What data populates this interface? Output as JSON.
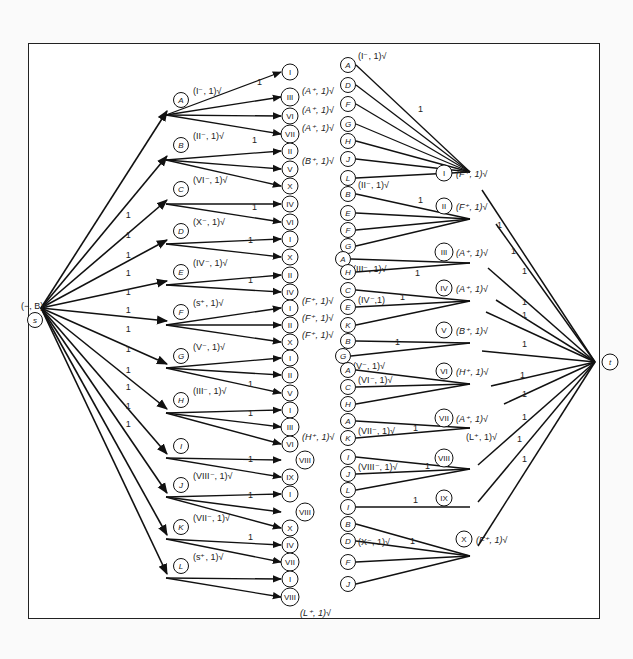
{
  "figure": {
    "stroke_color": "#111111",
    "border_color": "#222222"
  },
  "source": {
    "id": "s",
    "x": 35,
    "y": 308,
    "label": "(−, B)√"
  },
  "sink": {
    "id": "t",
    "x": 615,
    "y": 362
  },
  "left_nodes": [
    {
      "id": "A",
      "x": 181,
      "y": 100,
      "label": "(I⁻, 1)√",
      "hub_y": 115
    },
    {
      "id": "B",
      "x": 181,
      "y": 145,
      "label": "(II⁻, 1)√",
      "hub_y": 160
    },
    {
      "id": "C",
      "x": 181,
      "y": 189,
      "label": "(VI⁻, 1)√",
      "hub_y": 204
    },
    {
      "id": "D",
      "x": 181,
      "y": 231,
      "label": "(X⁻, 1)√",
      "hub_y": 244
    },
    {
      "id": "E",
      "x": 181,
      "y": 272,
      "label": "(IV⁻, 1)√",
      "hub_y": 285
    },
    {
      "id": "F",
      "x": 181,
      "y": 312,
      "label": "(s⁺, 1)√",
      "hub_y": 325
    },
    {
      "id": "G",
      "x": 181,
      "y": 356,
      "label": "(V⁻, 1)√",
      "hub_y": 368
    },
    {
      "id": "H",
      "x": 181,
      "y": 400,
      "label": "(III⁻, 1)√",
      "hub_y": 413
    },
    {
      "id": "I",
      "x": 181,
      "y": 446,
      "label": "",
      "hub_y": 458
    },
    {
      "id": "J",
      "x": 181,
      "y": 485,
      "label": "(VIII⁻, 1)√",
      "hub_y": 497
    },
    {
      "id": "K",
      "x": 181,
      "y": 527,
      "label": "(VII⁻, 1)√",
      "hub_y": 539
    },
    {
      "id": "L",
      "x": 181,
      "y": 566,
      "label": "(s⁺, 1)√",
      "hub_y": 578
    }
  ],
  "source_edges_label": "1",
  "mid_nodes": [
    {
      "id": "I",
      "x": 290,
      "y": 72,
      "from": "A",
      "label": ""
    },
    {
      "id": "III",
      "x": 290,
      "y": 97,
      "from": "A",
      "label": "(A⁺, 1)√",
      "lx": 302,
      "ly": 88
    },
    {
      "id": "VI",
      "x": 290,
      "y": 116,
      "from": "A",
      "label": "(A⁺, 1)√",
      "lx": 302,
      "ly": 107
    },
    {
      "id": "VII",
      "x": 290,
      "y": 134,
      "from": "A",
      "label": "(A⁺, 1)√",
      "lx": 302,
      "ly": 125
    },
    {
      "id": "II",
      "x": 290,
      "y": 151,
      "from": "B",
      "label": ""
    },
    {
      "id": "V",
      "x": 290,
      "y": 169,
      "from": "B",
      "label": "(B⁺, 1)√",
      "lx": 302,
      "ly": 158
    },
    {
      "id": "X",
      "x": 290,
      "y": 186,
      "from": "B",
      "label": ""
    },
    {
      "id": "IV",
      "x": 290,
      "y": 204,
      "from": "C",
      "label": ""
    },
    {
      "id": "VI",
      "x": 290,
      "y": 222,
      "from": "C",
      "label": ""
    },
    {
      "id": "I",
      "x": 290,
      "y": 239,
      "from": "D",
      "label": ""
    },
    {
      "id": "X",
      "x": 290,
      "y": 257,
      "from": "D",
      "label": ""
    },
    {
      "id": "II",
      "x": 290,
      "y": 275,
      "from": "E",
      "label": ""
    },
    {
      "id": "IV",
      "x": 290,
      "y": 292,
      "from": "E",
      "label": ""
    },
    {
      "id": "I",
      "x": 290,
      "y": 308,
      "from": "F",
      "label": "(F⁺, 1)√",
      "lx": 302,
      "ly": 298
    },
    {
      "id": "II",
      "x": 290,
      "y": 325,
      "from": "F",
      "label": "(F⁺, 1)√",
      "lx": 302,
      "ly": 315
    },
    {
      "id": "X",
      "x": 290,
      "y": 342,
      "from": "F",
      "label": "(F⁺, 1)√",
      "lx": 302,
      "ly": 332
    },
    {
      "id": "I",
      "x": 290,
      "y": 358,
      "from": "G",
      "label": ""
    },
    {
      "id": "II",
      "x": 290,
      "y": 375,
      "from": "G",
      "label": ""
    },
    {
      "id": "V",
      "x": 290,
      "y": 393,
      "from": "G",
      "label": ""
    },
    {
      "id": "I",
      "x": 290,
      "y": 410,
      "from": "H",
      "label": ""
    },
    {
      "id": "III",
      "x": 290,
      "y": 427,
      "from": "H",
      "label": ""
    },
    {
      "id": "VI",
      "x": 290,
      "y": 444,
      "from": "H",
      "label": "(H⁺, 1)√",
      "lx": 302,
      "ly": 434
    },
    {
      "id": "VIII",
      "x": 305,
      "y": 460,
      "from": null,
      "label": ""
    },
    {
      "id": "IX",
      "x": 290,
      "y": 477,
      "from": "I",
      "label": ""
    },
    {
      "id": "I",
      "x": 290,
      "y": 494,
      "from": "J",
      "label": ""
    },
    {
      "id": "VIII",
      "x": 305,
      "y": 512,
      "from": null,
      "label": ""
    },
    {
      "id": "X",
      "x": 290,
      "y": 528,
      "from": "J",
      "label": ""
    },
    {
      "id": "IV",
      "x": 290,
      "y": 545,
      "from": "K",
      "label": ""
    },
    {
      "id": "VII",
      "x": 290,
      "y": 562,
      "from": "K",
      "label": ""
    },
    {
      "id": "I",
      "x": 290,
      "y": 579,
      "from": "L",
      "label": ""
    },
    {
      "id": "VIII",
      "x": 290,
      "y": 597,
      "from": "L",
      "label": "(L⁺, 1)√",
      "lx": 300,
      "ly": 610
    }
  ],
  "mid_extra_arrows": [
    {
      "from": "I",
      "to_y": 460
    },
    {
      "from": "J",
      "to_y": 512
    }
  ],
  "left_edge_flow_labels": [
    {
      "text": "1",
      "x": 257,
      "y": 85
    },
    {
      "text": "1",
      "x": 252,
      "y": 143
    },
    {
      "text": "1",
      "x": 252,
      "y": 210
    },
    {
      "text": "1",
      "x": 248,
      "y": 243
    },
    {
      "text": "1",
      "x": 248,
      "y": 283
    },
    {
      "text": "1",
      "x": 248,
      "y": 387
    },
    {
      "text": "1",
      "x": 248,
      "y": 416
    },
    {
      "text": "1",
      "x": 248,
      "y": 462
    },
    {
      "text": "1",
      "x": 248,
      "y": 498
    },
    {
      "text": "1",
      "x": 248,
      "y": 540
    }
  ],
  "right_groups": [
    {
      "target": "I",
      "tx": 444,
      "ty": 173,
      "label": "(F⁺, 1)√",
      "hub_x": 470,
      "hub_y": 172,
      "items": [
        {
          "id": "A",
          "y": 65,
          "label": "(I⁻, 1)√",
          "lpos": "top"
        },
        {
          "id": "D",
          "y": 85
        },
        {
          "id": "F",
          "y": 104
        },
        {
          "id": "G",
          "y": 124
        },
        {
          "id": "H",
          "y": 141
        },
        {
          "id": "J",
          "y": 159
        },
        {
          "id": "L",
          "y": 178
        }
      ],
      "flow_label": {
        "text": "1",
        "x": 418,
        "y": 112
      }
    },
    {
      "target": "II",
      "tx": 444,
      "ty": 206,
      "label": "(F⁺, 1)√",
      "hub_x": 470,
      "hub_y": 219,
      "items": [
        {
          "id": "B",
          "y": 194,
          "label": "(II⁻, 1)√",
          "lpos": "top"
        },
        {
          "id": "E",
          "y": 213
        },
        {
          "id": "F",
          "y": 230
        },
        {
          "id": "G",
          "y": 246
        }
      ],
      "flow_label": {
        "text": "1",
        "x": 418,
        "y": 203
      }
    },
    {
      "target": "III",
      "tx": 444,
      "ty": 252,
      "label": "(A⁺, 1)√",
      "hub_x": 470,
      "hub_y": 263,
      "items": [
        {
          "id": "A",
          "y": 259,
          "x": 343,
          "label": "(III⁻, 1)√",
          "lpos": "below"
        },
        {
          "id": "H",
          "y": 272
        }
      ],
      "flow_label": {
        "text": "1",
        "x": 415,
        "y": 276
      }
    },
    {
      "target": "IV",
      "tx": 444,
      "ty": 288,
      "label": "(A⁺, 1)√",
      "hub_x": 470,
      "hub_y": 301,
      "items": [
        {
          "id": "C",
          "y": 290,
          "label": "(IV⁻,1)",
          "lpos": "below"
        },
        {
          "id": "E",
          "y": 307
        },
        {
          "id": "K",
          "y": 325
        }
      ],
      "flow_label": {
        "text": "1",
        "x": 400,
        "y": 300
      }
    },
    {
      "target": "V",
      "tx": 444,
      "ty": 330,
      "label": "(B⁺, 1)√",
      "hub_x": 470,
      "hub_y": 343,
      "items": [
        {
          "id": "B",
          "y": 341
        },
        {
          "id": "G",
          "y": 356,
          "x": 343,
          "label": "(V⁻, 1)√",
          "lpos": "below"
        }
      ],
      "flow_label": {
        "text": "1",
        "x": 395,
        "y": 345
      }
    },
    {
      "target": "VI",
      "tx": 444,
      "ty": 371,
      "label": "(H⁺, 1)√",
      "hub_x": 470,
      "hub_y": 384,
      "items": [
        {
          "id": "A",
          "y": 370,
          "label": "(VI⁻, 1)√",
          "lpos": "below"
        },
        {
          "id": "C",
          "y": 387
        },
        {
          "id": "H",
          "y": 404
        }
      ],
      "flow_label": null
    },
    {
      "target": "VII",
      "tx": 444,
      "ty": 418,
      "label": "(A⁺, 1)√",
      "hub_x": 470,
      "hub_y": 428,
      "items": [
        {
          "id": "A",
          "y": 421,
          "label": "(VII⁻, 1)√",
          "lpos": "below"
        },
        {
          "id": "K",
          "y": 438
        }
      ],
      "flow_label": {
        "text": "1",
        "x": 413,
        "y": 431
      },
      "extra_label": {
        "text": "(L⁺, 1)√",
        "x": 466,
        "y": 440
      }
    },
    {
      "target": "VIII",
      "tx": 444,
      "ty": 458,
      "label": "",
      "hub_x": 470,
      "hub_y": 469,
      "items": [
        {
          "id": "I",
          "y": 457,
          "label": "(VIII⁻, 1)√",
          "lpos": "below"
        },
        {
          "id": "J",
          "y": 474
        },
        {
          "id": "L",
          "y": 490
        }
      ],
      "flow_label": {
        "text": "1",
        "x": 425,
        "y": 469
      }
    },
    {
      "target": "IX",
      "tx": 444,
      "ty": 498,
      "label": "",
      "hub_x": 470,
      "hub_y": 507,
      "items": [
        {
          "id": "I",
          "y": 507
        }
      ],
      "flow_label": {
        "text": "1",
        "x": 413,
        "y": 503
      }
    },
    {
      "target": "X",
      "tx": 464,
      "ty": 539,
      "label": "(F⁺, 1)√",
      "hub_x": 470,
      "hub_y": 556,
      "items": [
        {
          "id": "B",
          "y": 524
        },
        {
          "id": "D",
          "y": 541,
          "label": "(X⁻, 1)√",
          "lpos": "right"
        },
        {
          "id": "F",
          "y": 562
        },
        {
          "id": "J",
          "y": 584
        }
      ],
      "flow_label": {
        "text": "1",
        "x": 410,
        "y": 544
      }
    }
  ],
  "right_col_x": 348,
  "sink_edges": [
    {
      "from_x": 482,
      "from_y": 190,
      "label": "1",
      "lx": 497,
      "ly": 228
    },
    {
      "from_x": 496,
      "from_y": 224,
      "label": "1",
      "lx": 511,
      "ly": 254
    },
    {
      "from_x": 488,
      "from_y": 268,
      "label": "1",
      "lx": 522,
      "ly": 274
    },
    {
      "from_x": 496,
      "from_y": 300,
      "label": "1",
      "lx": 522,
      "ly": 305
    },
    {
      "from_x": 486,
      "from_y": 312,
      "label": "1",
      "lx": 522,
      "ly": 318
    },
    {
      "from_x": 482,
      "from_y": 351,
      "label": "1",
      "lx": 522,
      "ly": 347
    },
    {
      "from_x": 491,
      "from_y": 386,
      "label": "1",
      "lx": 520,
      "ly": 378
    },
    {
      "from_x": 504,
      "from_y": 404,
      "label": "1",
      "lx": 522,
      "ly": 397
    },
    {
      "from_x": 478,
      "from_y": 465,
      "label": "1",
      "lx": 522,
      "ly": 420
    },
    {
      "from_x": 478,
      "from_y": 502,
      "label": "1",
      "lx": 517,
      "ly": 442
    },
    {
      "from_x": 478,
      "from_y": 546,
      "label": "1",
      "lx": 522,
      "ly": 462
    }
  ],
  "sink_arrow_into": {
    "x": 595,
    "y": 362
  }
}
